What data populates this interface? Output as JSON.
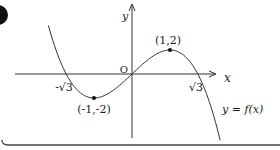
{
  "figure": {
    "axis_labels": {
      "x": "x",
      "y": "y",
      "origin": "O"
    },
    "x_intercepts": [
      {
        "label": "-√3",
        "value": "-√3"
      },
      {
        "label": "√3",
        "value": "√3"
      }
    ],
    "extrema": [
      {
        "type": "local-min",
        "label": "(-1,-2)",
        "x": -1,
        "y": -2
      },
      {
        "type": "local-max",
        "label": "(1,2)",
        "x": 1,
        "y": 2
      }
    ],
    "curve_label": "y = f(x)",
    "colors": {
      "ink": "#222222",
      "background": "#ffffff",
      "marker": "#111111"
    }
  },
  "chart_data": {
    "type": "line",
    "title": "",
    "xlabel": "x",
    "ylabel": "y",
    "function": "f(x) = -x^3 + 3x",
    "x": [
      -2.2,
      -1.732,
      -1,
      0,
      1,
      1.732,
      2.6
    ],
    "values": [
      4.05,
      0,
      -2,
      0,
      2,
      0,
      -9.78
    ],
    "annotations": [
      "-√3",
      "√3",
      "(-1,-2)",
      "(1,2)",
      "O",
      "y=f(x)"
    ],
    "grid": false
  }
}
